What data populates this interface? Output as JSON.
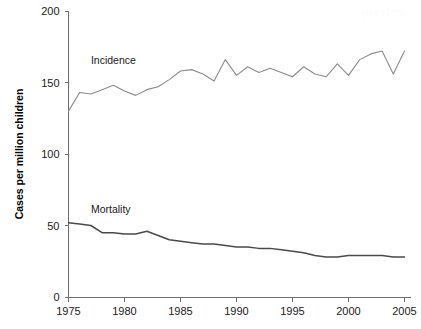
{
  "chart_data": {
    "type": "line",
    "title": "",
    "subtitle": "",
    "xlabel": "",
    "ylabel": "Cases per million children",
    "xlim": [
      1975,
      2005
    ],
    "ylim": [
      0,
      200
    ],
    "grid": false,
    "legend_position": "inline-annotation",
    "x": [
      1975,
      1976,
      1977,
      1978,
      1979,
      1980,
      1981,
      1982,
      1983,
      1984,
      1985,
      1986,
      1987,
      1988,
      1989,
      1990,
      1991,
      1992,
      1993,
      1994,
      1995,
      1996,
      1997,
      1998,
      1999,
      2000,
      2001,
      2002,
      2003,
      2004,
      2005
    ],
    "x_ticks": [
      1975,
      1980,
      1985,
      1990,
      1995,
      2000,
      2005
    ],
    "x_tick_labels": [
      "1975",
      "1980",
      "1985",
      "1990",
      "1995",
      "2000",
      "2005"
    ],
    "y_ticks": [
      0,
      50,
      100,
      150,
      200
    ],
    "y_tick_labels": [
      "0",
      "50",
      "100",
      "150",
      "200"
    ],
    "series": [
      {
        "name": "Incidence",
        "color": "#8a8a8a",
        "label_x": 1977.0,
        "label_y": 163,
        "values": [
          130,
          143,
          142,
          145,
          148,
          144,
          141,
          145,
          147,
          152,
          158,
          159,
          156,
          151,
          166,
          155,
          161,
          157,
          160,
          157,
          154,
          161,
          156,
          154,
          163,
          155,
          166,
          170,
          172,
          156,
          172
        ]
      },
      {
        "name": "Mortality",
        "color": "#4a4a4a",
        "label_x": 1977.0,
        "label_y": 59,
        "values": [
          52,
          51,
          50,
          45,
          45,
          44,
          44,
          46,
          43,
          40,
          39,
          38,
          37,
          37,
          36,
          35,
          35,
          34,
          34,
          33,
          32,
          31,
          29,
          28,
          28,
          29,
          29,
          29,
          29,
          28,
          28
        ]
      }
    ]
  },
  "annotations": {
    "incidence_label": "Incidence",
    "mortality_label": "Mortality"
  },
  "watermark": {
    "text": "preview"
  }
}
